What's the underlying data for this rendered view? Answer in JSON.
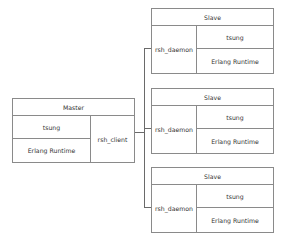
{
  "diagram": {
    "master": {
      "title": "Master",
      "layers": [
        "tsung",
        "Erlang Runtime"
      ],
      "side": "rsh_client"
    },
    "slaves": [
      {
        "title": "Slave",
        "side": "rsh_daemon",
        "layers": [
          "tsung",
          "Erlang Runtime"
        ]
      },
      {
        "title": "Slave",
        "side": "rsh_daemon",
        "layers": [
          "tsung",
          "Erlang Runtime"
        ]
      },
      {
        "title": "Slave",
        "side": "rsh_daemon",
        "layers": [
          "tsung",
          "Erlang Runtime"
        ]
      }
    ],
    "colors": {
      "border": "#8a8a8a",
      "connector": "#6a6a6a",
      "text": "#333333"
    }
  }
}
